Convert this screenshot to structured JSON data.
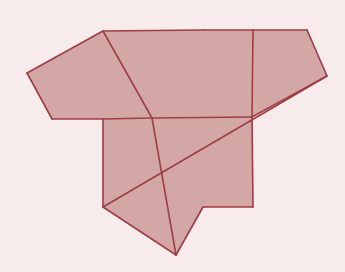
{
  "figure": {
    "kind": "geometric-net-diagram",
    "width": 345,
    "height": 272,
    "background_color": "#f7ebeb",
    "face_fill_color": "#d4a7a7",
    "stroke_color": "#9e3d44",
    "stroke_width": 1.6
  },
  "chart_data": {
    "type": "diagram",
    "xlabel": "",
    "ylabel": "",
    "xlim": [
      0,
      345
    ],
    "ylim": [
      0,
      272
    ],
    "grid": false,
    "legend": "none",
    "faces": [
      {
        "name": "left-pentagon",
        "sides": 5,
        "points": [
          [
            103,
            31
          ],
          [
            152,
            118
          ],
          [
            103,
            119
          ],
          [
            52,
            119
          ],
          [
            27,
            73
          ]
        ]
      },
      {
        "name": "top-center-pentagon",
        "sides": 5,
        "points": [
          [
            203,
            30
          ],
          [
            253,
            30
          ],
          [
            253,
            117
          ],
          [
            152,
            118
          ],
          [
            103,
            31
          ]
        ]
      },
      {
        "name": "top-right-pentagon",
        "sides": 5,
        "points": [
          [
            253,
            30
          ],
          [
            307,
            30
          ],
          [
            327,
            76
          ],
          [
            252,
            117
          ],
          [
            253,
            30
          ]
        ]
      },
      {
        "name": "bottom-left-pentagon",
        "sides": 5,
        "points": [
          [
            103,
            119
          ],
          [
            152,
            118
          ],
          [
            176,
            255
          ],
          [
            103,
            207
          ],
          [
            103,
            119
          ]
        ]
      },
      {
        "name": "bottom-right-pentagon",
        "sides": 5,
        "points": [
          [
            252,
            117
          ],
          [
            253,
            207
          ],
          [
            203,
            207
          ],
          [
            176,
            255
          ],
          [
            152,
            118
          ]
        ]
      }
    ],
    "edges": [
      {
        "name": "pentagon-left-upper-left",
        "from": [
          27,
          73
        ],
        "to": [
          103,
          31
        ]
      },
      {
        "name": "pentagon-left-lower-left",
        "from": [
          27,
          73
        ],
        "to": [
          52,
          119
        ]
      },
      {
        "name": "pentagon-left-bottom",
        "from": [
          52,
          119
        ],
        "to": [
          103,
          119
        ]
      },
      {
        "name": "pentagon-left-bottom-right",
        "from": [
          103,
          119
        ],
        "to": [
          152,
          118
        ]
      },
      {
        "name": "pentagon-left-diagonal-right",
        "from": [
          103,
          31
        ],
        "to": [
          152,
          118
        ]
      },
      {
        "name": "top-center-left-diagonal",
        "from": [
          103,
          31
        ],
        "to": [
          203,
          30
        ]
      },
      {
        "name": "top-center-top-edge",
        "from": [
          203,
          30
        ],
        "to": [
          253,
          30
        ]
      },
      {
        "name": "top-center-right-vertical",
        "from": [
          253,
          30
        ],
        "to": [
          252,
          117
        ]
      },
      {
        "name": "top-center-bottom-diagonal",
        "from": [
          252,
          117
        ],
        "to": [
          152,
          118
        ]
      },
      {
        "name": "top-right-top-edge",
        "from": [
          253,
          30
        ],
        "to": [
          307,
          30
        ]
      },
      {
        "name": "top-right-upper-right",
        "from": [
          307,
          30
        ],
        "to": [
          327,
          76
        ]
      },
      {
        "name": "top-right-lower-right",
        "from": [
          327,
          76
        ],
        "to": [
          252,
          117
        ]
      },
      {
        "name": "bottom-left-vertical",
        "from": [
          103,
          119
        ],
        "to": [
          103,
          207
        ]
      },
      {
        "name": "bottom-left-lower-diagonal",
        "from": [
          103,
          207
        ],
        "to": [
          176,
          255
        ]
      },
      {
        "name": "bottom-left-right-diagonal",
        "from": [
          152,
          118
        ],
        "to": [
          176,
          255
        ]
      },
      {
        "name": "bottom-right-vertical",
        "from": [
          252,
          117
        ],
        "to": [
          253,
          207
        ]
      },
      {
        "name": "bottom-right-bottom-edge",
        "from": [
          253,
          207
        ],
        "to": [
          203,
          207
        ]
      },
      {
        "name": "bottom-right-lower-left",
        "from": [
          203,
          207
        ],
        "to": [
          176,
          255
        ]
      },
      {
        "name": "crossing-diagonal-long",
        "from": [
          103,
          207
        ],
        "to": [
          327,
          76
        ]
      }
    ],
    "vertices": [
      {
        "name": "v-left-apex",
        "x": 27,
        "y": 73
      },
      {
        "name": "v-pentagon-top",
        "x": 103,
        "y": 31
      },
      {
        "name": "v-left-bottom-left",
        "x": 52,
        "y": 119
      },
      {
        "name": "v-center-left",
        "x": 103,
        "y": 119
      },
      {
        "name": "v-center-junction",
        "x": 152,
        "y": 118
      },
      {
        "name": "v-top-center-left",
        "x": 203,
        "y": 30
      },
      {
        "name": "v-top-mid",
        "x": 253,
        "y": 30
      },
      {
        "name": "v-top-right",
        "x": 307,
        "y": 30
      },
      {
        "name": "v-right-apex",
        "x": 327,
        "y": 76
      },
      {
        "name": "v-right-junction",
        "x": 252,
        "y": 117
      },
      {
        "name": "v-left-lower",
        "x": 103,
        "y": 207
      },
      {
        "name": "v-bottom-apex",
        "x": 176,
        "y": 255
      },
      {
        "name": "v-bottom-right-left",
        "x": 203,
        "y": 207
      },
      {
        "name": "v-bottom-right",
        "x": 253,
        "y": 207
      },
      {
        "name": "v-crossing-upper",
        "x": 176,
        "y": 77
      },
      {
        "name": "v-crossing-lower",
        "x": 176,
        "y": 163
      }
    ]
  }
}
